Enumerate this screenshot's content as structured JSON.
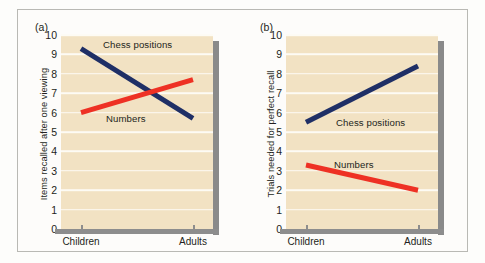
{
  "figure": {
    "panels": [
      {
        "key": "a",
        "tag": "(a)",
        "ylabel": "Items recalled after one viewing",
        "yticks": [
          "10",
          "9",
          "8",
          "7",
          "6",
          "5",
          "4",
          "3",
          "2",
          "1",
          "0"
        ],
        "xticklabels": [
          "Children",
          "Adults"
        ],
        "series_labels": {
          "chess": "Chess positions",
          "numbers": "Numbers"
        }
      },
      {
        "key": "b",
        "tag": "(b)",
        "ylabel": "Trials needed for perfect recall",
        "yticks": [
          "10",
          "9",
          "8",
          "7",
          "6",
          "5",
          "4",
          "3",
          "2",
          "1",
          "0"
        ],
        "xticklabels": [
          "Children",
          "Adults"
        ],
        "series_labels": {
          "chess": "Chess positions",
          "numbers": "Numbers"
        }
      }
    ],
    "colors": {
      "chess_line": "#1f2f66",
      "numbers_line": "#ee3124",
      "plot_background": "#f2e2c3",
      "gridline": "#fdfbf4",
      "axis_bar": "#8d8d8d",
      "text": "#231f20",
      "frame": "#b9b9b4"
    }
  },
  "chart_data": [
    {
      "type": "line",
      "panel": "(a)",
      "title": "",
      "xlabel": "",
      "ylabel": "Items recalled after one viewing",
      "categories": [
        "Children",
        "Adults"
      ],
      "ylim": [
        0,
        10
      ],
      "yticks": [
        0,
        1,
        2,
        3,
        4,
        5,
        6,
        7,
        8,
        9,
        10
      ],
      "grid": true,
      "legend": "inline-labels",
      "series": [
        {
          "name": "Chess positions",
          "values": [
            9.3,
            5.7
          ],
          "color": "#1f2f66"
        },
        {
          "name": "Numbers",
          "values": [
            6.0,
            7.7
          ],
          "color": "#ee3124"
        }
      ]
    },
    {
      "type": "line",
      "panel": "(b)",
      "title": "",
      "xlabel": "",
      "ylabel": "Trials needed for perfect recall",
      "categories": [
        "Children",
        "Adults"
      ],
      "ylim": [
        0,
        10
      ],
      "yticks": [
        0,
        1,
        2,
        3,
        4,
        5,
        6,
        7,
        8,
        9,
        10
      ],
      "grid": true,
      "legend": "inline-labels",
      "series": [
        {
          "name": "Chess positions",
          "values": [
            5.5,
            8.4
          ],
          "color": "#1f2f66"
        },
        {
          "name": "Numbers",
          "values": [
            3.3,
            2.0
          ],
          "color": "#ee3124"
        }
      ]
    }
  ]
}
